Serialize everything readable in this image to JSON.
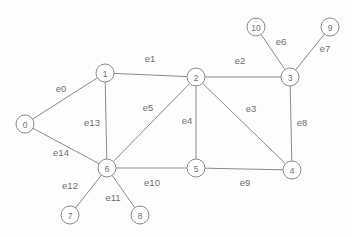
{
  "figure": {
    "width": 352,
    "height": 237,
    "background_color": "#fdfdfd",
    "stroke_color": "#8a8a8a",
    "text_color": "#6f6f6f"
  },
  "chart_data": {
    "type": "diagram",
    "diagram_kind": "undirected-graph",
    "title": "",
    "nodes": [
      {
        "id": "0",
        "label": "0",
        "x": 25,
        "y": 124
      },
      {
        "id": "1",
        "label": "1",
        "x": 105,
        "y": 73
      },
      {
        "id": "2",
        "label": "2",
        "x": 196,
        "y": 77
      },
      {
        "id": "3",
        "label": "3",
        "x": 290,
        "y": 77
      },
      {
        "id": "4",
        "label": "4",
        "x": 292,
        "y": 170
      },
      {
        "id": "5",
        "label": "5",
        "x": 196,
        "y": 168
      },
      {
        "id": "6",
        "label": "6",
        "x": 107,
        "y": 168
      },
      {
        "id": "7",
        "label": "7",
        "x": 70,
        "y": 215
      },
      {
        "id": "8",
        "label": "8",
        "x": 140,
        "y": 215
      },
      {
        "id": "9",
        "label": "9",
        "x": 330,
        "y": 27
      },
      {
        "id": "10",
        "label": "10",
        "x": 256,
        "y": 27
      }
    ],
    "node_radius": 9,
    "edges": [
      {
        "id": "e0",
        "label": "e0",
        "source": "0",
        "target": "1",
        "label_x": 61,
        "label_y": 88
      },
      {
        "id": "e1",
        "label": "e1",
        "source": "1",
        "target": "2",
        "label_x": 150,
        "label_y": 58
      },
      {
        "id": "e2",
        "label": "e2",
        "source": "2",
        "target": "3",
        "label_x": 240,
        "label_y": 60
      },
      {
        "id": "e3",
        "label": "e3",
        "source": "2",
        "target": "4",
        "label_x": 251,
        "label_y": 108
      },
      {
        "id": "e4",
        "label": "e4",
        "source": "2",
        "target": "5",
        "label_x": 187,
        "label_y": 120
      },
      {
        "id": "e5",
        "label": "e5",
        "source": "2",
        "target": "6",
        "label_x": 148,
        "label_y": 107
      },
      {
        "id": "e6",
        "label": "e6",
        "source": "10",
        "target": "3",
        "label_x": 281,
        "label_y": 41
      },
      {
        "id": "e7",
        "label": "e7",
        "source": "9",
        "target": "3",
        "label_x": 325,
        "label_y": 48
      },
      {
        "id": "e8",
        "label": "e8",
        "source": "3",
        "target": "4",
        "label_x": 302,
        "label_y": 122
      },
      {
        "id": "e9",
        "label": "e9",
        "source": "5",
        "target": "4",
        "label_x": 245,
        "label_y": 182
      },
      {
        "id": "e10",
        "label": "e10",
        "source": "6",
        "target": "5",
        "label_x": 152,
        "label_y": 182
      },
      {
        "id": "e11",
        "label": "e11",
        "source": "6",
        "target": "8",
        "label_x": 113,
        "label_y": 197
      },
      {
        "id": "e12",
        "label": "e12",
        "source": "6",
        "target": "7",
        "label_x": 70,
        "label_y": 185
      },
      {
        "id": "e13",
        "label": "e13",
        "source": "1",
        "target": "6",
        "label_x": 92,
        "label_y": 122
      },
      {
        "id": "e14",
        "label": "e14",
        "source": "0",
        "target": "6",
        "label_x": 61,
        "label_y": 152
      }
    ]
  }
}
